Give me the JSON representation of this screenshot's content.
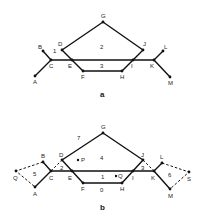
{
  "figures": [
    {
      "caption": "a",
      "vertices": {
        "A": {
          "label": "A"
        },
        "B": {
          "label": "B"
        },
        "C": {
          "label": "C"
        },
        "D": {
          "label": "D"
        },
        "E": {
          "label": "E"
        },
        "F": {
          "label": "F"
        },
        "G": {
          "label": "G"
        },
        "H": {
          "label": "H"
        },
        "I": {
          "label": "I"
        },
        "J": {
          "label": "J"
        },
        "K": {
          "label": "K"
        },
        "L": {
          "label": "L"
        },
        "M": {
          "label": "M"
        }
      },
      "faces": {
        "f1": "1",
        "f2": "2",
        "f3": "3"
      }
    },
    {
      "caption": "b",
      "vertices": {
        "A": {
          "label": "A"
        },
        "B": {
          "label": "B"
        },
        "C": {
          "label": "C"
        },
        "D": {
          "label": "D"
        },
        "E": {
          "label": "E"
        },
        "F": {
          "label": "F"
        },
        "G": {
          "label": "G"
        },
        "H": {
          "label": "H"
        },
        "I": {
          "label": "I"
        },
        "J": {
          "label": "J"
        },
        "K": {
          "label": "K"
        },
        "L": {
          "label": "L"
        },
        "M": {
          "label": "M"
        },
        "Q": {
          "label": "Q"
        },
        "S": {
          "label": "S"
        }
      },
      "points": {
        "P": "P",
        "Q": "Q"
      },
      "faces": {
        "f0": "0",
        "f1": "1",
        "f2": "2",
        "f3": "3",
        "f4": "4",
        "f5": "5",
        "f6": "6",
        "f7": "7"
      }
    }
  ]
}
